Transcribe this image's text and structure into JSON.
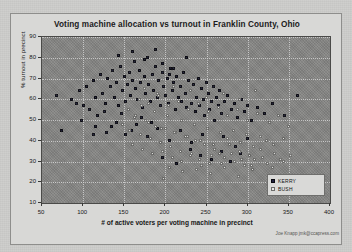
{
  "chart_data": {
    "type": "scatter",
    "title": "Voting machine allocation vs turnout in Franklin County, Ohio",
    "xlabel": "# of active voters per voting machine in precinct",
    "ylabel": "% turnout in precinct",
    "xlim": [
      50,
      400
    ],
    "ylim": [
      10,
      90
    ],
    "xticks": [
      50,
      100,
      150,
      200,
      250,
      300,
      350,
      400
    ],
    "yticks": [
      10,
      20,
      30,
      40,
      50,
      60,
      70,
      80,
      90
    ],
    "grid": true,
    "legend_position": "bottom-right",
    "plot_background": "#858583",
    "series": [
      {
        "name": "KERRY",
        "color": "#20203e",
        "marker": "square",
        "points": [
          [
            68,
            62
          ],
          [
            74,
            45
          ],
          [
            86,
            60
          ],
          [
            92,
            58
          ],
          [
            96,
            64
          ],
          [
            101,
            57
          ],
          [
            104,
            66
          ],
          [
            108,
            55
          ],
          [
            112,
            69
          ],
          [
            115,
            61
          ],
          [
            118,
            52
          ],
          [
            121,
            72
          ],
          [
            124,
            63
          ],
          [
            127,
            58
          ],
          [
            130,
            70
          ],
          [
            133,
            66
          ],
          [
            136,
            74
          ],
          [
            138,
            61
          ],
          [
            141,
            68
          ],
          [
            143,
            57
          ],
          [
            146,
            76
          ],
          [
            148,
            64
          ],
          [
            150,
            71
          ],
          [
            152,
            59
          ],
          [
            154,
            67
          ],
          [
            156,
            73
          ],
          [
            158,
            62
          ],
          [
            160,
            69
          ],
          [
            162,
            78
          ],
          [
            164,
            65
          ],
          [
            166,
            60
          ],
          [
            168,
            74
          ],
          [
            170,
            68
          ],
          [
            172,
            56
          ],
          [
            174,
            71
          ],
          [
            176,
            63
          ],
          [
            178,
            80
          ],
          [
            180,
            67
          ],
          [
            182,
            59
          ],
          [
            184,
            72
          ],
          [
            186,
            64
          ],
          [
            188,
            76
          ],
          [
            190,
            61
          ],
          [
            192,
            69
          ],
          [
            194,
            57
          ],
          [
            196,
            73
          ],
          [
            198,
            66
          ],
          [
            200,
            62
          ],
          [
            202,
            70
          ],
          [
            204,
            58
          ],
          [
            206,
            75
          ],
          [
            208,
            64
          ],
          [
            210,
            68
          ],
          [
            212,
            55
          ],
          [
            214,
            71
          ],
          [
            216,
            61
          ],
          [
            218,
            66
          ],
          [
            220,
            59
          ],
          [
            222,
            73
          ],
          [
            224,
            63
          ],
          [
            226,
            56
          ],
          [
            228,
            69
          ],
          [
            230,
            64
          ],
          [
            232,
            58
          ],
          [
            234,
            67
          ],
          [
            236,
            54
          ],
          [
            238,
            61
          ],
          [
            240,
            70
          ],
          [
            242,
            57
          ],
          [
            244,
            65
          ],
          [
            246,
            60
          ],
          [
            248,
            52
          ],
          [
            250,
            68
          ],
          [
            252,
            63
          ],
          [
            254,
            55
          ],
          [
            256,
            59
          ],
          [
            258,
            66
          ],
          [
            260,
            50
          ],
          [
            262,
            61
          ],
          [
            264,
            57
          ],
          [
            266,
            64
          ],
          [
            268,
            53
          ],
          [
            272,
            59
          ],
          [
            276,
            62
          ],
          [
            280,
            55
          ],
          [
            284,
            58
          ],
          [
            288,
            51
          ],
          [
            292,
            60
          ],
          [
            296,
            54
          ],
          [
            300,
            57
          ],
          [
            305,
            50
          ],
          [
            312,
            56
          ],
          [
            320,
            53
          ],
          [
            330,
            58
          ],
          [
            345,
            52
          ],
          [
            360,
            62
          ],
          [
            115,
            47
          ],
          [
            128,
            44
          ],
          [
            140,
            49
          ],
          [
            152,
            43
          ],
          [
            165,
            48
          ],
          [
            178,
            42
          ],
          [
            190,
            46
          ],
          [
            205,
            40
          ],
          [
            218,
            45
          ],
          [
            232,
            39
          ],
          [
            245,
            43
          ],
          [
            258,
            38
          ],
          [
            270,
            42
          ],
          [
            285,
            37
          ],
          [
            300,
            41
          ],
          [
            315,
            36
          ],
          [
            160,
            83
          ],
          [
            175,
            79
          ],
          [
            143,
            81
          ],
          [
            196,
            77
          ],
          [
            210,
            75
          ],
          [
            225,
            80
          ],
          [
            188,
            84
          ],
          [
            205,
            72
          ],
          [
            98,
            50
          ],
          [
            112,
            43
          ],
          [
            126,
            54
          ],
          [
            135,
            47
          ],
          [
            147,
            53
          ],
          [
            159,
            45
          ],
          [
            171,
            51
          ],
          [
            183,
            49
          ],
          [
            243,
            33
          ],
          [
            256,
            31
          ],
          [
            268,
            35
          ],
          [
            279,
            30
          ],
          [
            291,
            34
          ],
          [
            196,
            32
          ],
          [
            213,
            29
          ],
          [
            230,
            36
          ]
        ]
      },
      {
        "name": "BUSH",
        "color": "#e8e8e6",
        "marker": "square",
        "points": [
          [
            148,
            48
          ],
          [
            156,
            45
          ],
          [
            164,
            52
          ],
          [
            170,
            43
          ],
          [
            176,
            50
          ],
          [
            182,
            41
          ],
          [
            188,
            47
          ],
          [
            194,
            39
          ],
          [
            200,
            46
          ],
          [
            206,
            37
          ],
          [
            212,
            44
          ],
          [
            218,
            35
          ],
          [
            224,
            42
          ],
          [
            230,
            33
          ],
          [
            236,
            40
          ],
          [
            242,
            31
          ],
          [
            248,
            38
          ],
          [
            254,
            29
          ],
          [
            260,
            36
          ],
          [
            266,
            34
          ],
          [
            272,
            32
          ],
          [
            278,
            38
          ],
          [
            284,
            30
          ],
          [
            290,
            35
          ],
          [
            296,
            28
          ],
          [
            302,
            33
          ],
          [
            308,
            31
          ],
          [
            316,
            36
          ],
          [
            324,
            29
          ],
          [
            332,
            34
          ],
          [
            340,
            31
          ],
          [
            352,
            33
          ],
          [
            155,
            55
          ],
          [
            163,
            51
          ],
          [
            171,
            57
          ],
          [
            179,
            49
          ],
          [
            187,
            54
          ],
          [
            195,
            46
          ],
          [
            203,
            52
          ],
          [
            211,
            44
          ],
          [
            219,
            50
          ],
          [
            227,
            42
          ],
          [
            235,
            48
          ],
          [
            243,
            40
          ],
          [
            251,
            46
          ],
          [
            259,
            38
          ],
          [
            267,
            44
          ],
          [
            275,
            41
          ],
          [
            283,
            45
          ],
          [
            291,
            39
          ],
          [
            299,
            43
          ],
          [
            307,
            37
          ],
          [
            315,
            42
          ],
          [
            323,
            40
          ],
          [
            331,
            38
          ],
          [
            343,
            41
          ],
          [
            168,
            60
          ],
          [
            180,
            58
          ],
          [
            192,
            62
          ],
          [
            204,
            57
          ],
          [
            216,
            59
          ],
          [
            228,
            55
          ],
          [
            240,
            58
          ],
          [
            252,
            54
          ],
          [
            264,
            56
          ],
          [
            276,
            52
          ],
          [
            288,
            55
          ],
          [
            300,
            50
          ],
          [
            312,
            53
          ],
          [
            326,
            49
          ],
          [
            338,
            52
          ],
          [
            350,
            47
          ],
          [
            205,
            27
          ],
          [
            221,
            25
          ],
          [
            238,
            26
          ],
          [
            255,
            24
          ],
          [
            272,
            27
          ],
          [
            289,
            23
          ],
          [
            306,
            26
          ],
          [
            198,
            22
          ],
          [
            160,
            38
          ],
          [
            172,
            36
          ],
          [
            184,
            34
          ],
          [
            196,
            35
          ],
          [
            208,
            32
          ],
          [
            220,
            30
          ],
          [
            232,
            34
          ],
          [
            244,
            28
          ],
          [
            256,
            33
          ],
          [
            268,
            29
          ],
          [
            280,
            34
          ],
          [
            292,
            31
          ],
          [
            304,
            28
          ],
          [
            318,
            32
          ],
          [
            330,
            27
          ],
          [
            344,
            30
          ],
          [
            175,
            65
          ],
          [
            190,
            63
          ],
          [
            210,
            66
          ],
          [
            230,
            64
          ],
          [
            250,
            61
          ],
          [
            270,
            63
          ],
          [
            290,
            60
          ],
          [
            310,
            64
          ]
        ]
      }
    ],
    "credit": "Joe Knapp   jmk@ccapress.com"
  }
}
